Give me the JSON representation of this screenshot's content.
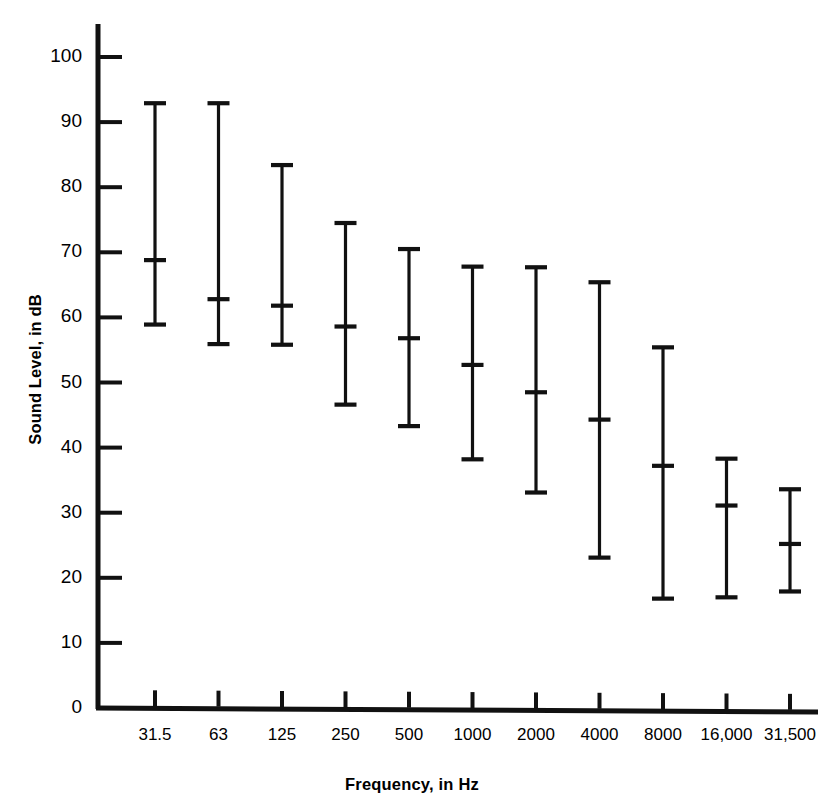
{
  "chart_data": {
    "type": "error-bar",
    "title": "",
    "xlabel": "Frequency, in Hz",
    "ylabel": "Sound Level, in dB",
    "categories": [
      "31.5",
      "63",
      "125",
      "250",
      "500",
      "1000",
      "2000",
      "4000",
      "8000",
      "16,000",
      "31,500"
    ],
    "y_ticks": [
      0,
      10,
      20,
      30,
      40,
      50,
      60,
      70,
      80,
      90,
      100
    ],
    "ylim": [
      0,
      104
    ],
    "grid": false,
    "legend": null,
    "series": [
      {
        "name": "Sound Level range",
        "mean": [
          68.8,
          62.8,
          61.8,
          58.6,
          56.8,
          52.7,
          48.5,
          44.3,
          37.2,
          31.1,
          25.2
        ],
        "upper": [
          92.9,
          92.9,
          83.4,
          74.5,
          70.5,
          67.8,
          67.7,
          65.4,
          55.4,
          38.3,
          33.6
        ],
        "lower": [
          58.9,
          55.9,
          55.8,
          46.6,
          43.3,
          38.2,
          33.1,
          23.1,
          16.8,
          17.0,
          17.9
        ]
      }
    ]
  },
  "axes": {
    "y_axis_label": "Sound Level, in dB",
    "x_axis_label": "Frequency, in Hz"
  },
  "style": {
    "line_color": "#111111",
    "background": "#ffffff"
  }
}
